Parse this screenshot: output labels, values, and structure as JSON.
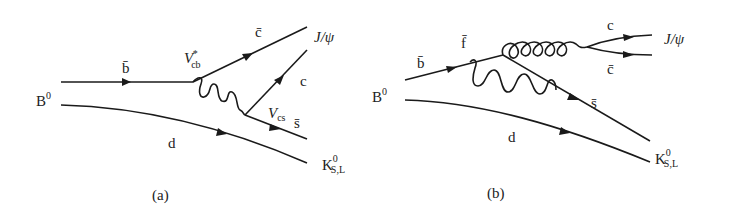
{
  "diagrams": [
    {
      "caption": "(a)",
      "initial_meson": {
        "base": "B",
        "sup": "0"
      },
      "quark_in": "b̄",
      "spectator": "d",
      "vertex_top": {
        "base": "V",
        "sub": "cb",
        "sup": "*"
      },
      "vertex_bottom": {
        "base": "V",
        "sub": "cs"
      },
      "out_top_quark": "c̄",
      "out_mid_quark": "c",
      "out_low_quark": "s̄",
      "final_top": "J/ψ",
      "final_bottom": {
        "base": "K",
        "sup": "0",
        "sub": "S,L"
      }
    },
    {
      "caption": "(b)",
      "initial_meson": {
        "base": "B",
        "sup": "0"
      },
      "quark_in": "b̄",
      "internal_quark": "f̄",
      "spectator": "d",
      "out_c": "c",
      "out_cbar": "c̄",
      "out_sbar": "s̄",
      "final_top": "J/ψ",
      "final_bottom": {
        "base": "K",
        "sup": "0",
        "sub": "S,L"
      }
    }
  ]
}
